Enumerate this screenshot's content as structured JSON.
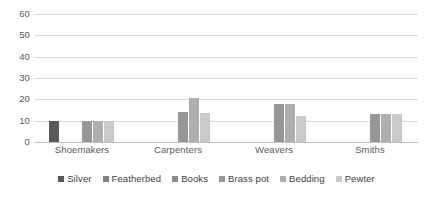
{
  "chart_data": {
    "type": "bar",
    "title": "",
    "subtitle": "",
    "xlabel": "",
    "ylabel": "",
    "categories": [
      "Shoemakers",
      "Carpenters",
      "Weavers",
      "Smiths"
    ],
    "series": [
      {
        "name": "Silver",
        "color": "#595959",
        "values": [
          10,
          0,
          0,
          0
        ]
      },
      {
        "name": "Featherbed",
        "color": "#7f7f7f",
        "values": [
          0,
          0,
          0,
          0
        ]
      },
      {
        "name": "Books",
        "color": "#8c8c8c",
        "values": [
          0,
          0,
          0,
          0
        ]
      },
      {
        "name": "Brass pot",
        "color": "#979797",
        "values": [
          10,
          14,
          18,
          13
        ]
      },
      {
        "name": "Bedding",
        "color": "#aeaeae",
        "values": [
          10,
          20.5,
          18,
          13
        ]
      },
      {
        "name": "Pewter",
        "color": "#c9c9c9",
        "values": [
          10,
          13.5,
          12,
          13
        ]
      }
    ],
    "ylim": [
      0,
      60
    ],
    "ytick_step": 10,
    "yticks": [
      "0",
      "10",
      "20",
      "30",
      "40",
      "50",
      "60"
    ],
    "grid": true,
    "grid_axis": "y",
    "legend_position": "bottom",
    "gridline_color": "#d9d9d9",
    "axis_text_color": "#595959",
    "background_color": "#ffffff"
  }
}
